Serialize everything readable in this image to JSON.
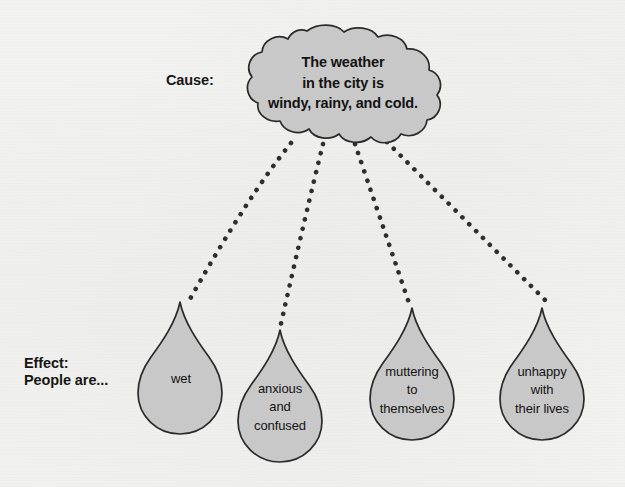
{
  "page": {
    "background_color": "#f2f2f0",
    "shape_fill_color": "#c8c8c8",
    "shape_outline_color": "#2a2a2a",
    "dot_color": "#2e2e2e",
    "text_color": "#131313"
  },
  "cause": {
    "label": "Cause:",
    "cloud_text": "The weather\nin the city is\nwindy, rainy, and cold."
  },
  "effect": {
    "label": "Effect:\nPeople are...",
    "drops": [
      {
        "id": "drop-wet",
        "text": "wet"
      },
      {
        "id": "drop-anxious",
        "text": "anxious\nand\nconfused"
      },
      {
        "id": "drop-muttering",
        "text": "muttering\nto\nthemselves"
      },
      {
        "id": "drop-unhappy",
        "text": "unhappy\nwith\ntheir lives"
      }
    ]
  },
  "connectors": {
    "count": 4,
    "style": "dotted",
    "description": "dotted rain lines from cloud to each droplet"
  }
}
